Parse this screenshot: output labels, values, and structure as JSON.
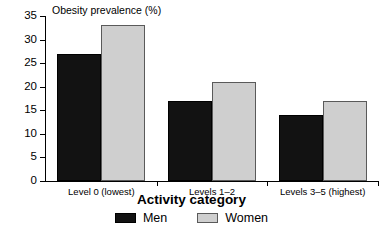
{
  "chart_data": {
    "type": "bar",
    "title": "",
    "ylabel": "Obesity prevalence (%)",
    "xlabel": "Activity category",
    "categories": [
      "Level 0 (lowest)",
      "Levels 1–2",
      "Levels 3–5 (highest)"
    ],
    "series": [
      {
        "name": "Men",
        "color": "#121212",
        "values": [
          27,
          17,
          14
        ]
      },
      {
        "name": "Women",
        "color": "#cfcfcf",
        "values": [
          33,
          21,
          17
        ]
      }
    ],
    "ylim": [
      0,
      35
    ],
    "yticks": [
      0,
      5,
      10,
      15,
      20,
      25,
      30,
      35
    ],
    "ytick_labels": [
      "0",
      "5",
      "10",
      "15",
      "20",
      "25",
      "30",
      "35"
    ],
    "grid": false,
    "legend_position": "bottom-center",
    "legend": [
      {
        "label": "Men",
        "color": "#121212"
      },
      {
        "label": "Women",
        "color": "#cfcfcf"
      }
    ]
  }
}
